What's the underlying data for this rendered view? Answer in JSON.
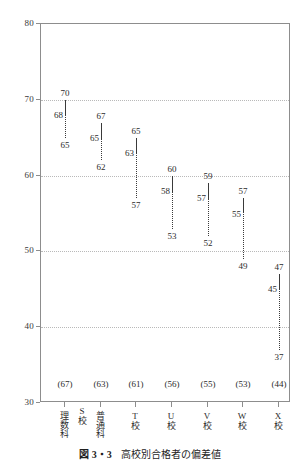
{
  "chart_data": {
    "type": "line",
    "title": "高校別合格者の偏差値",
    "figure_number": "図 3・3",
    "xlabel": "",
    "ylabel": "",
    "ylim": [
      30,
      80
    ],
    "yticks": [
      30,
      40,
      50,
      60,
      70,
      80
    ],
    "ytick_labels": [
      "30",
      "40",
      "50",
      "60",
      "70",
      "80"
    ],
    "grid": true,
    "gridlines_at": [
      40,
      50,
      60,
      70
    ],
    "legend": "none",
    "note": "Each column shows max (top label), mean (middle label, end of solid segment) and min (bottom label, end of dotted segment). Solid segment runs max→mean, dotted segment runs mean→min.",
    "categories": [
      "理数科",
      "普通科",
      "T校",
      "U校",
      "V校",
      "W校",
      "X校"
    ],
    "group_labels": [
      {
        "label": "S校",
        "spans": [
          "理数科",
          "普通科"
        ]
      }
    ],
    "sample_sizes": [
      "(67)",
      "(63)",
      "(61)",
      "(56)",
      "(55)",
      "(53)",
      "(44)"
    ],
    "series": [
      {
        "name": "max",
        "values": [
          70,
          67,
          65,
          60,
          59,
          57,
          47
        ]
      },
      {
        "name": "mean",
        "values": [
          68,
          65,
          63,
          58,
          57,
          55,
          45
        ]
      },
      {
        "name": "min",
        "values": [
          65,
          62,
          57,
          53,
          52,
          49,
          37
        ]
      }
    ],
    "points": [
      {
        "category": "理数科",
        "n": "(67)",
        "max": 70,
        "mean": 68,
        "min": 65,
        "max_label": "70",
        "mean_label": "68",
        "min_label": "65"
      },
      {
        "category": "普通科",
        "n": "(63)",
        "max": 67,
        "mean": 65,
        "min": 62,
        "max_label": "67",
        "mean_label": "65",
        "min_label": "62"
      },
      {
        "category": "T校",
        "n": "(61)",
        "max": 65,
        "mean": 63,
        "min": 57,
        "max_label": "65",
        "mean_label": "63",
        "min_label": "57"
      },
      {
        "category": "U校",
        "n": "(56)",
        "max": 60,
        "mean": 58,
        "min": 53,
        "max_label": "60",
        "mean_label": "58",
        "min_label": "53"
      },
      {
        "category": "V校",
        "n": "(55)",
        "max": 59,
        "mean": 57,
        "min": 52,
        "max_label": "59",
        "mean_label": "57",
        "min_label": "52"
      },
      {
        "category": "W校",
        "n": "(53)",
        "max": 57,
        "mean": 55,
        "min": 49,
        "max_label": "57",
        "mean_label": "55",
        "min_label": "49"
      },
      {
        "category": "X校",
        "n": "(44)",
        "max": 47,
        "mean": 45,
        "min": 37,
        "max_label": "47",
        "mean_label": "45",
        "min_label": "37"
      }
    ],
    "colors": {
      "line": "#3a3a3a",
      "grid": "#b9b9b9",
      "frame": "#8d8d8d",
      "text": "#2b2b2b",
      "background": "#ffffff"
    }
  },
  "caption": {
    "number": "図 3・3",
    "text": "高校別合格者の偏差値"
  }
}
